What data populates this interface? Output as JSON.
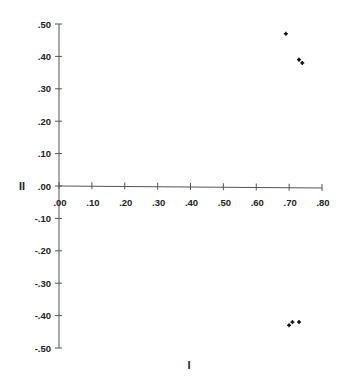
{
  "chart_data": {
    "type": "scatter",
    "title": "",
    "xlabel": "I",
    "ylabel": "II",
    "xlim": [
      0.0,
      0.8
    ],
    "ylim": [
      -0.5,
      0.5
    ],
    "grid": false,
    "legend": null,
    "x_ticks": [
      ".00",
      ".10",
      ".20",
      ".30",
      ".40",
      ".50",
      ".60",
      ".70",
      ".80"
    ],
    "y_ticks": [
      ".50",
      ".40",
      ".30",
      ".20",
      ".10",
      ".00",
      "-.10",
      "-.20",
      "-.30",
      "-.40",
      "-.50"
    ],
    "series": [
      {
        "name": "points",
        "marker": "star",
        "x": [
          0.69,
          0.73,
          0.74,
          0.7,
          0.71,
          0.73
        ],
        "y": [
          0.47,
          0.39,
          0.38,
          -0.43,
          -0.42,
          -0.42
        ]
      }
    ]
  },
  "colors": {
    "axis": "#555555",
    "text": "#222222",
    "marker": "#111111"
  }
}
